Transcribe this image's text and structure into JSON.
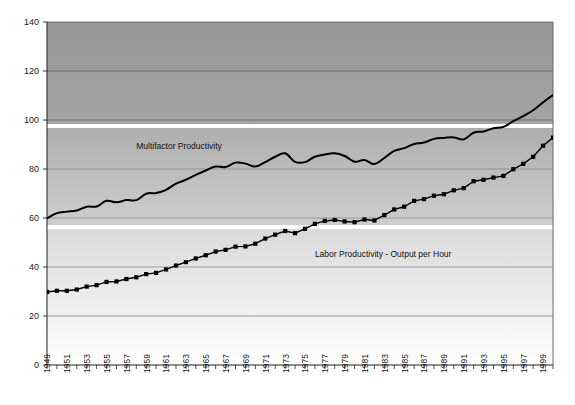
{
  "chart_data": {
    "type": "line",
    "title": "",
    "subtitle": "",
    "xlabel": "",
    "ylabel": "",
    "xlim": [
      1949,
      2000
    ],
    "ylim": [
      0,
      140
    ],
    "grid": true,
    "legend_position": "inline-annotations",
    "ytick_labels": [
      "0",
      "20",
      "40",
      "60",
      "80",
      "100",
      "120",
      "140"
    ],
    "ytick_values": [
      0,
      20,
      40,
      60,
      80,
      100,
      120,
      140
    ],
    "xtick_labels": [
      "1949",
      "1951",
      "1953",
      "1955",
      "1957",
      "1959",
      "1961",
      "1963",
      "1965",
      "1967",
      "1969",
      "1971",
      "1973",
      "1975",
      "1977",
      "1979",
      "1981",
      "1983",
      "1985",
      "1987",
      "1989",
      "1991",
      "1993",
      "1995",
      "1997",
      "1999"
    ],
    "xtick_values": [
      1949,
      1951,
      1953,
      1955,
      1957,
      1959,
      1961,
      1963,
      1965,
      1967,
      1969,
      1971,
      1973,
      1975,
      1977,
      1979,
      1981,
      1983,
      1985,
      1987,
      1989,
      1991,
      1993,
      1995,
      1997,
      1999
    ],
    "x": [
      1949,
      1950,
      1951,
      1952,
      1953,
      1954,
      1955,
      1956,
      1957,
      1958,
      1959,
      1960,
      1961,
      1962,
      1963,
      1964,
      1965,
      1966,
      1967,
      1968,
      1969,
      1970,
      1971,
      1972,
      1973,
      1974,
      1975,
      1976,
      1977,
      1978,
      1979,
      1980,
      1981,
      1982,
      1983,
      1984,
      1985,
      1986,
      1987,
      1988,
      1989,
      1990,
      1991,
      1992,
      1993,
      1994,
      1995,
      1996,
      1997,
      1998,
      1999,
      2000
    ],
    "series": [
      {
        "name": "Multifactor Productivity",
        "marker": "none",
        "color": "#000000",
        "label_x": 1958,
        "label_y": 88,
        "values": [
          59.8,
          62.0,
          62.6,
          63.1,
          64.6,
          64.7,
          67.0,
          66.4,
          67.3,
          67.3,
          69.9,
          70.2,
          71.5,
          74.0,
          75.6,
          77.6,
          79.4,
          81.0,
          80.8,
          82.6,
          82.2,
          81.0,
          82.8,
          85.0,
          86.4,
          82.9,
          82.8,
          85.0,
          85.9,
          86.4,
          85.3,
          83.0,
          83.7,
          82.0,
          84.5,
          87.4,
          88.5,
          90.2,
          90.8,
          92.3,
          92.7,
          92.9,
          92.1,
          94.8,
          95.3,
          96.6,
          97.2,
          99.5,
          101.6,
          104.0,
          107.2,
          110.2
        ]
      },
      {
        "name": "Labor Productivity - Output per Hour",
        "marker": "square",
        "color": "#000000",
        "label_x": 1976,
        "label_y": 44,
        "values": [
          29.8,
          30.3,
          30.3,
          30.8,
          32.0,
          32.6,
          33.9,
          34.1,
          35.1,
          35.8,
          37.1,
          37.6,
          39.0,
          40.6,
          42.0,
          43.5,
          44.8,
          46.3,
          47.0,
          48.3,
          48.4,
          49.5,
          51.6,
          53.2,
          54.7,
          53.8,
          55.6,
          57.6,
          58.8,
          59.2,
          58.6,
          58.3,
          59.4,
          59.0,
          61.2,
          63.5,
          64.6,
          67.0,
          67.7,
          69.1,
          69.7,
          71.3,
          72.2,
          75.0,
          75.6,
          76.5,
          77.2,
          79.9,
          82.1,
          85.0,
          89.5,
          92.8
        ]
      }
    ],
    "banding": {
      "top_color": "#9a9a9a",
      "bottom_color": "#ffffff",
      "band_breaks": [
        100,
        60
      ],
      "description": "vertical grayscale gradient background with white separator bands"
    }
  },
  "axes": {
    "plot_left": 47,
    "plot_right": 553,
    "plot_top": 22,
    "plot_bottom": 365
  }
}
